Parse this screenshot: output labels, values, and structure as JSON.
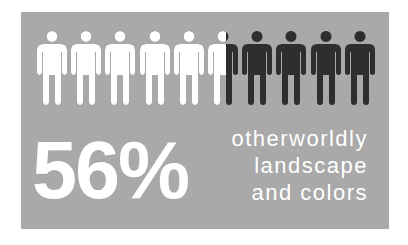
{
  "infographic": {
    "stat_value": "56%",
    "caption_lines": [
      "otherworldly",
      "landscape",
      "and colors"
    ],
    "pictogram": {
      "icon": "person-icon",
      "total": 10,
      "filled": 5.6,
      "filled_color": "#ffffff",
      "empty_color": "#2e2e2e"
    },
    "colors": {
      "panel_background": "#a9a9a9",
      "text": "#ffffff"
    }
  }
}
